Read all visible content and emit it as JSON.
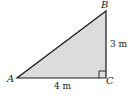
{
  "diagram": {
    "type": "right-triangle",
    "fill_color": "#d9d9d9",
    "stroke_color": "#1a1a1a",
    "vertices": {
      "A": {
        "label": "A"
      },
      "B": {
        "label": "B"
      },
      "C": {
        "label": "C"
      }
    },
    "sides": {
      "AC": {
        "label": "4 m"
      },
      "BC": {
        "label": "3 m"
      }
    },
    "right_angle_at": "C"
  }
}
